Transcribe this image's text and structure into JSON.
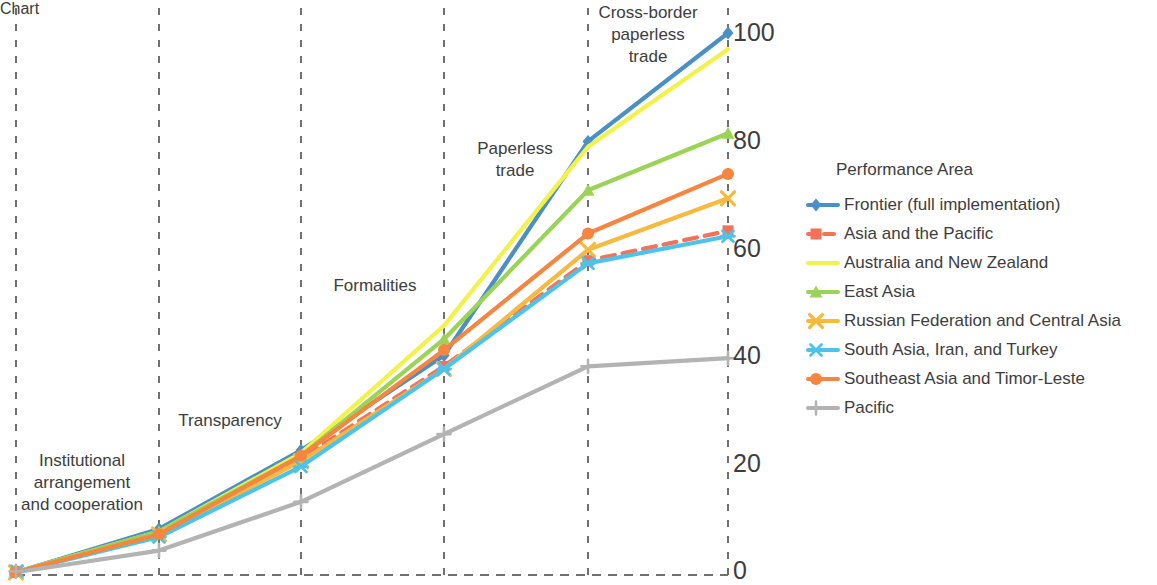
{
  "legend": {
    "title": "Performance Area",
    "entries": [
      {
        "label": "Frontier (full implementation)",
        "color": "#4a90c4",
        "marker": "diamond",
        "dash": "solid"
      },
      {
        "label": "Asia and the Pacific",
        "color": "#f4715a",
        "marker": "square",
        "dash": "dashed"
      },
      {
        "label": "Australia and New Zealand",
        "color": "#f2f24a",
        "marker": "none",
        "dash": "solid"
      },
      {
        "label": "East Asia",
        "color": "#9ad355",
        "marker": "triangle",
        "dash": "solid"
      },
      {
        "label": "Russian Federation and Central Asia",
        "color": "#f7b93f",
        "marker": "cross",
        "dash": "solid"
      },
      {
        "label": "South Asia, Iran, and Turkey",
        "color": "#4ec3ea",
        "marker": "asterisk",
        "dash": "solid"
      },
      {
        "label": "Southeast Asia and Timor-Leste",
        "color": "#f5853f",
        "marker": "circle",
        "dash": "solid"
      },
      {
        "label": "Pacific",
        "color": "#b3b3b3",
        "marker": "plus",
        "dash": "solid"
      }
    ]
  },
  "axis": {
    "y_ticks": [
      "0",
      "20",
      "40",
      "60",
      "80",
      "100"
    ],
    "y_min": 0,
    "y_max": 100,
    "category_labels": [
      "Institutional\narrangement\nand cooperation",
      "Transparency",
      "Formalities",
      "Paperless\ntrade",
      "Cross-border\npaperless\ntrade"
    ]
  },
  "chart_data": {
    "type": "line",
    "title": "",
    "xlabel": "",
    "ylabel": "",
    "ylim": [
      0,
      100
    ],
    "grid": "vertical-dashed",
    "legend_position": "right",
    "categories": [
      "",
      "Institutional arrangement and cooperation",
      "Transparency",
      "Formalities",
      "Paperless trade",
      "Cross-border paperless trade"
    ],
    "series": [
      {
        "name": "Frontier (full implementation)",
        "color": "#4a90c4",
        "values": [
          0.5,
          8.5,
          23,
          40.5,
          80,
          100
        ]
      },
      {
        "name": "Asia and the Pacific",
        "color": "#f4715a",
        "values": [
          0.5,
          7.5,
          21.5,
          38.5,
          58,
          63.5
        ]
      },
      {
        "name": "Australia and New Zealand",
        "color": "#f2f24a",
        "values": [
          0.5,
          8,
          22.5,
          46,
          79,
          97
        ]
      },
      {
        "name": "East Asia",
        "color": "#9ad355",
        "values": [
          0.5,
          8,
          22,
          43.5,
          71,
          81.5
        ]
      },
      {
        "name": "Russian Federation and Central Asia",
        "color": "#f7b93f",
        "values": [
          0.5,
          7.5,
          21,
          38,
          60,
          69.5
        ]
      },
      {
        "name": "South Asia, Iran, and Turkey",
        "color": "#4ec3ea",
        "values": [
          0.5,
          7,
          20,
          38,
          57.5,
          62.5
        ]
      },
      {
        "name": "Southeast Asia and Timor-Leste",
        "color": "#f5853f",
        "values": [
          0.5,
          7.5,
          22,
          41.5,
          63,
          74
        ]
      },
      {
        "name": "Pacific",
        "color": "#b3b3b3",
        "values": [
          0.5,
          4.5,
          13.5,
          26,
          38.5,
          40
        ]
      }
    ]
  }
}
